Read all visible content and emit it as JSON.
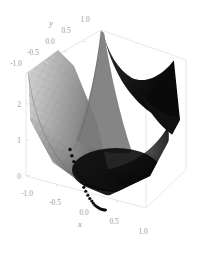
{
  "figure": {
    "kind": "3d-surface-plot",
    "background_color": "#ffffff",
    "frame_color": "#e2e2e2",
    "tick_label_color": "#9a9a9a",
    "marker_color": "#0d0d0d"
  },
  "axes": {
    "x": {
      "title": "x",
      "ticks": [
        "-1.0",
        "-0.5",
        "0.0",
        "0.5",
        "1.0"
      ],
      "range": [
        -1.0,
        1.0
      ]
    },
    "y": {
      "title": "y",
      "ticks": [
        "1.0",
        "0.5",
        "0.0",
        "-0.5",
        "-1.0"
      ],
      "range": [
        -1.0,
        1.0
      ]
    },
    "z": {
      "title": "",
      "ticks": [
        "0",
        "1",
        "2"
      ],
      "range": [
        0,
        2.4
      ]
    }
  },
  "chart_data": {
    "type": "surface",
    "title": "",
    "xlabel": "x",
    "ylabel": "y",
    "zlabel": "",
    "xlim": [
      -1.0,
      1.0
    ],
    "ylim": [
      -1.0,
      1.0
    ],
    "zlim": [
      0,
      2.4
    ],
    "grid": true,
    "legend": "none",
    "surface": {
      "expression": "z = x^2 + y^2",
      "colormap": "grayscale",
      "mesh": true,
      "mesh_color": "#6f6f6f",
      "light_shade": "#c8c8c8",
      "mid_shade": "#8a8a8a",
      "dark_shade": "#121212"
    },
    "overlay_points": {
      "name": "gradient-descent-path",
      "marker": "filled-circle",
      "color": "#0d0d0d",
      "count": 26,
      "x": [
        -0.9,
        -0.86,
        -0.82,
        -0.77,
        -0.72,
        -0.67,
        -0.62,
        -0.57,
        -0.52,
        -0.47,
        -0.42,
        -0.37,
        -0.33,
        -0.29,
        -0.25,
        -0.21,
        -0.18,
        -0.15,
        -0.12,
        -0.1,
        -0.08,
        -0.06,
        -0.045,
        -0.03,
        -0.02,
        -0.01
      ],
      "y": [
        0.9,
        0.85,
        0.8,
        0.75,
        0.7,
        0.65,
        0.6,
        0.55,
        0.5,
        0.45,
        0.4,
        0.35,
        0.31,
        0.27,
        0.23,
        0.2,
        0.17,
        0.14,
        0.11,
        0.09,
        0.07,
        0.055,
        0.04,
        0.03,
        0.02,
        0.01
      ],
      "z": [
        1.62,
        1.46,
        1.31,
        1.16,
        1.03,
        0.9,
        0.77,
        0.63,
        0.52,
        0.42,
        0.33,
        0.26,
        0.2,
        0.15,
        0.11,
        0.08,
        0.06,
        0.04,
        0.03,
        0.02,
        0.01,
        0.007,
        0.004,
        0.002,
        0.001,
        0.0002
      ]
    }
  }
}
